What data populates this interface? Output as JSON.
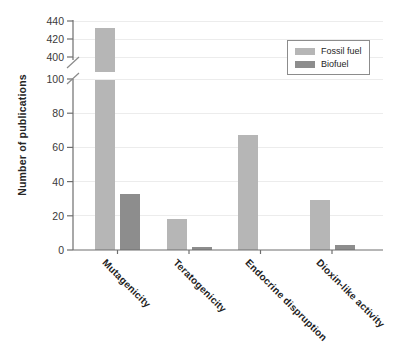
{
  "figure": {
    "background": "#ffffff",
    "axis_color": "#6e6e6e",
    "grid_color": "#ececec"
  },
  "chart_data": {
    "type": "bar",
    "title": "",
    "xlabel": "",
    "ylabel": "Number of publications",
    "categories": [
      "Mutagenicity",
      "Teratogenicity",
      "Endocrine dispruption",
      "Dioxin-like activity"
    ],
    "series": [
      {
        "name": "Fossil fuel",
        "color": "#b6b6b6",
        "values": [
          432,
          18,
          67,
          29
        ]
      },
      {
        "name": "Biofuel",
        "color": "#8d8d8d",
        "values": [
          33,
          2,
          0,
          3
        ]
      }
    ],
    "y_axis": {
      "broken": true,
      "segments": [
        {
          "range": [
            0,
            100
          ],
          "ticks": [
            0,
            20,
            40,
            60,
            80,
            100
          ]
        },
        {
          "range": [
            400,
            440
          ],
          "ticks": [
            400,
            420,
            440
          ]
        }
      ]
    },
    "grid": "horizontal-major",
    "legend_position": "upper-right"
  }
}
